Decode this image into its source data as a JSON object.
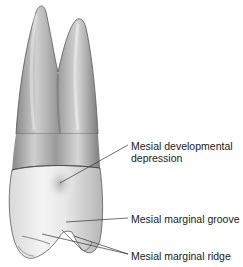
{
  "figure": {
    "labels": {
      "developmental_depression_line1": "Mesial developmental",
      "developmental_depression_line2": "depression",
      "marginal_groove": "Mesial marginal groove",
      "marginal_ridge": "Mesial marginal ridge"
    },
    "colors": {
      "background": "#ffffff",
      "tooth_dark": "#6e6e6e",
      "tooth_mid": "#a9a9a9",
      "tooth_light": "#e6e6e6",
      "text": "#1a1a1a",
      "leader_line": "#333333"
    }
  }
}
